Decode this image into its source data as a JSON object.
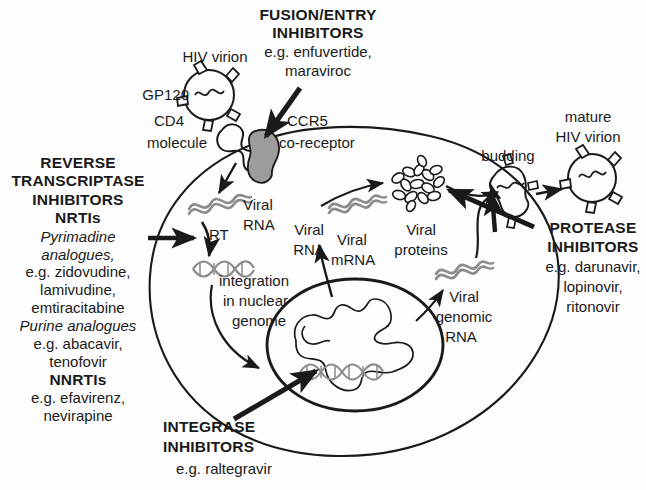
{
  "figure": {
    "background_color": "#fdfdfd",
    "ink_color": "#1a1a1a",
    "nucleic_acid_color": "#8c8c8c",
    "coreceptor_fill": "#9c9c9c"
  },
  "drug_classes": {
    "fusion_entry": {
      "heading_line1": "FUSION/ENTRY",
      "heading_line2": "INHIBITORS",
      "examples_line1": "e.g. enfuvertide,",
      "examples_line2": "maraviroc"
    },
    "reverse_transcriptase": {
      "heading_line1": "REVERSE",
      "heading_line2": "TRANSCRIPTASE",
      "heading_line3": "INHIBITORS",
      "subclass_nrti": "NRTIs",
      "nrti_group1_line1": "Pyrimadine",
      "nrti_group1_line2": "analogues,",
      "nrti_group1_examples_line1": "e.g. zidovudine,",
      "nrti_group1_examples_line2": "lamivudine,",
      "nrti_group1_examples_line3": "emtiracitabine",
      "nrti_group2": "Purine analogues",
      "nrti_group2_examples_line1": "e.g. abacavir,",
      "nrti_group2_examples_line2": "tenofovir",
      "subclass_nnrti": "NNRTIs",
      "nnrti_examples_line1": "e.g. efavirenz,",
      "nnrti_examples_line2": "nevirapine"
    },
    "integrase": {
      "heading_line1": "INTEGRASE",
      "heading_line2": "INHIBITORS",
      "examples": "e.g. raltegravir"
    },
    "protease": {
      "heading_line1": "PROTEASE",
      "heading_line2": "INHIBITORS",
      "examples_line1": "e.g. darunavir,",
      "examples_line2": "lopinovir,",
      "examples_line3": "ritonovir"
    }
  },
  "structures": {
    "hiv_virion": "HIV virion",
    "gp120": "GP120",
    "cd4_line1": "CD4",
    "cd4_line2": "molecule",
    "ccr5_line1": "CCR5",
    "ccr5_line2": "co-receptor",
    "viral_rna_entry_line1": "Viral",
    "viral_rna_entry_line2": "RNA",
    "rt_enzyme": "RT",
    "integration_line1": "integration",
    "integration_line2": "in nuclear",
    "integration_line3": "genome",
    "viral_rna_mid_line1": "Viral",
    "viral_rna_mid_line2": "RNA",
    "viral_mrna_line1": "Viral",
    "viral_mrna_line2": "mRNA",
    "viral_proteins_line1": "Viral",
    "viral_proteins_line2": "proteins",
    "viral_genomic_rna_line1": "Viral",
    "viral_genomic_rna_line2": "genomic",
    "viral_genomic_rna_line3": "RNA",
    "budding": "budding",
    "mature_virion_line1": "mature",
    "mature_virion_line2": "HIV virion"
  }
}
